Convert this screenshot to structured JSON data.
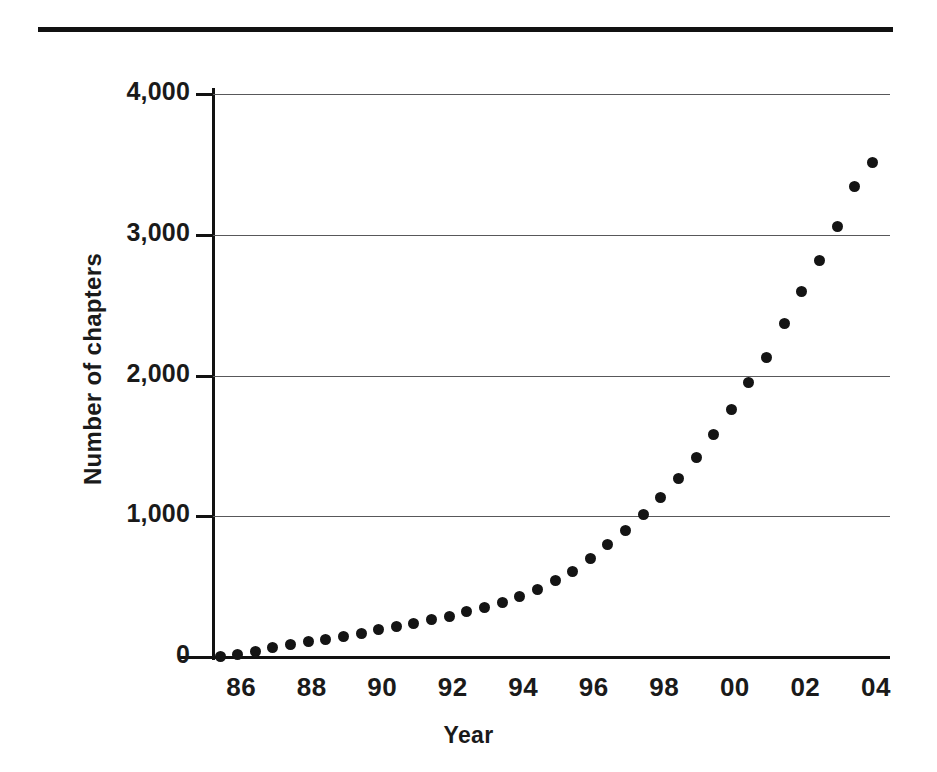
{
  "chart_data": {
    "type": "scatter",
    "title": "",
    "xlabel": "Year",
    "ylabel": "Number of chapters",
    "xlim": [
      1985.2,
      2004.4
    ],
    "ylim": [
      0,
      4000
    ],
    "grid": true,
    "legend": false,
    "marker": "filled-circle",
    "x_tick_labels": [
      "86",
      "88",
      "90",
      "92",
      "94",
      "96",
      "98",
      "00",
      "02",
      "04"
    ],
    "x_tick_values": [
      1986,
      1988,
      1990,
      1992,
      1994,
      1996,
      1998,
      2000,
      2002,
      2004
    ],
    "y_tick_labels": [
      "0",
      "1,000",
      "2,000",
      "3,000",
      "4,000"
    ],
    "y_tick_values": [
      0,
      1000,
      2000,
      3000,
      4000
    ],
    "x": [
      1985.4,
      1985.9,
      1986.4,
      1986.9,
      1987.4,
      1987.9,
      1988.4,
      1988.9,
      1989.4,
      1989.9,
      1990.4,
      1990.9,
      1991.4,
      1991.9,
      1992.4,
      1992.9,
      1993.4,
      1993.9,
      1994.4,
      1994.9,
      1995.4,
      1995.9,
      1996.4,
      1996.9,
      1997.4,
      1997.9,
      1998.4,
      1998.9,
      1999.4,
      1999.9,
      2000.4,
      2000.9,
      2001.4,
      2001.9,
      2002.4,
      2002.9,
      2003.4,
      2003.9
    ],
    "values": [
      5,
      20,
      40,
      65,
      90,
      110,
      125,
      145,
      170,
      195,
      215,
      240,
      265,
      290,
      320,
      355,
      390,
      430,
      480,
      540,
      610,
      700,
      800,
      900,
      1010,
      1130,
      1270,
      1420,
      1580,
      1760,
      1950,
      2130,
      2370,
      2600,
      2820,
      3060,
      3340,
      3510
    ],
    "annotations": []
  },
  "axes": {
    "y_title": "Number of chapters",
    "x_title": "Year"
  },
  "colors": {
    "marker": "#141414",
    "gridline": "#58585a",
    "axis": "#111111",
    "rule": "#111111",
    "background": "#ffffff",
    "text": "#1a1a1a"
  }
}
